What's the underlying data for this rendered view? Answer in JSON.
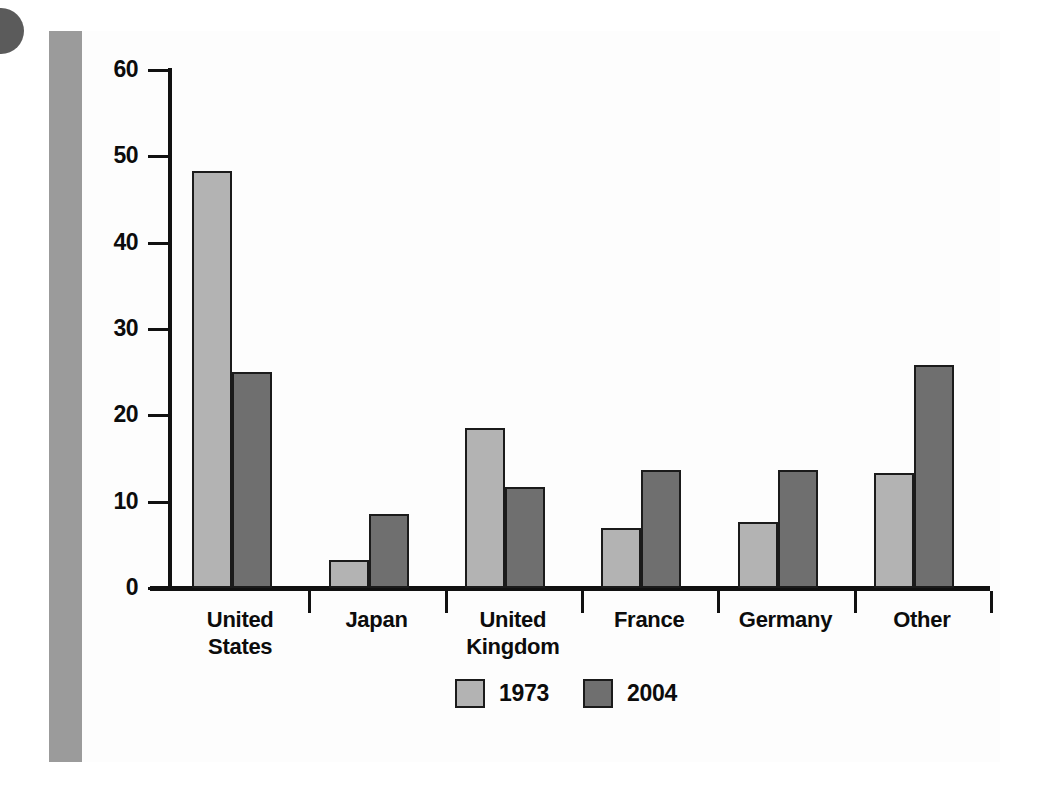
{
  "chart_data": {
    "type": "bar",
    "title": "",
    "subtitle": "",
    "xlabel": "",
    "ylabel": "",
    "ylim": [
      0,
      60
    ],
    "yticks": [
      0,
      10,
      20,
      30,
      40,
      50,
      60
    ],
    "ytick_labels": [
      "0",
      "10",
      "20",
      "30",
      "40",
      "50",
      "60"
    ],
    "grid": false,
    "legend_position": "bottom-center",
    "categories": [
      "United States",
      "Japan",
      "United Kingdom",
      "France",
      "Germany",
      "Other"
    ],
    "category_lines": [
      [
        "United",
        "States"
      ],
      [
        "Japan"
      ],
      [
        "United",
        "Kingdom"
      ],
      [
        "France"
      ],
      [
        "Germany"
      ],
      [
        "Other"
      ]
    ],
    "series": [
      {
        "name": "1973",
        "color": "#b3b3b3",
        "values": [
          48.3,
          3.3,
          18.5,
          6.9,
          7.6,
          13.3
        ]
      },
      {
        "name": "2004",
        "color": "#6f6f6f",
        "values": [
          25.0,
          8.6,
          11.7,
          13.7,
          13.7,
          25.8
        ]
      }
    ]
  },
  "legend": {
    "entries": [
      {
        "label": "1973",
        "swatch": "light-gray-swatch"
      },
      {
        "label": "2004",
        "swatch": "dark-gray-swatch"
      }
    ]
  },
  "decor": {
    "corner_dot": "page-corner-dot",
    "left_band_color": "#9b9b9b",
    "panel_color": "#fdfdfd"
  }
}
